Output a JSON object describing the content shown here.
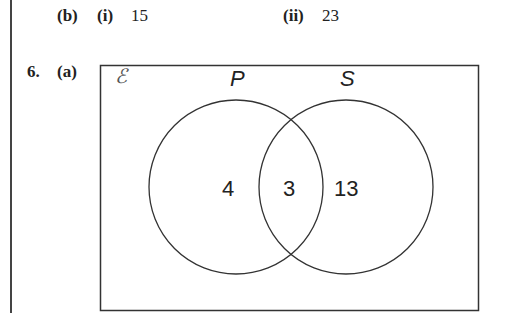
{
  "part_b": {
    "label": "(b)",
    "sub_i": {
      "label": "(i)",
      "value": "15"
    },
    "sub_ii": {
      "label": "(ii)",
      "value": "23"
    }
  },
  "question6": {
    "number": "6.",
    "part": "(a)",
    "venn": {
      "universal_symbol": "ℰ",
      "set_labels": {
        "left": "P",
        "right": "S"
      },
      "regions": {
        "p_only": "4",
        "intersection": "3",
        "s_only": "13"
      }
    }
  }
}
